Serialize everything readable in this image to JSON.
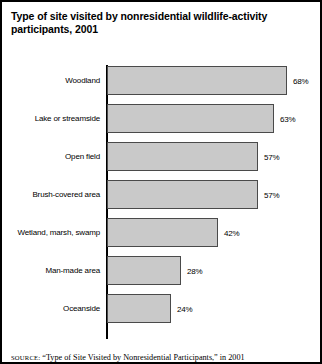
{
  "figure": {
    "title": "Type of site visited by nonresidential wildlife-activity participants, 2001",
    "source": "SOURCE: \"Type of Site Visited by Nonresidential Participants,\" in 2001",
    "source_prefix": "SOURCE:",
    "source_rest": " “Type of Site Visited by Nonresidential Participants,” in 2001",
    "bar_fill": "#c9c9c9",
    "bar_stroke": "#4a4a4a",
    "axis_color": "#000000",
    "border_color": "#000000"
  },
  "chart_data": {
    "type": "bar",
    "orientation": "horizontal",
    "title": "Type of site visited by nonresidential wildlife-activity participants, 2001",
    "xlabel": "",
    "ylabel": "",
    "xlim": [
      0,
      68
    ],
    "grid": false,
    "legend": null,
    "value_suffix": "%",
    "categories": [
      "Woodland",
      "Lake or streamside",
      "Open field",
      "Brush-covered area",
      "Wetland, marsh, swamp",
      "Man-made area",
      "Oceanside"
    ],
    "values": [
      68,
      63,
      57,
      57,
      42,
      28,
      24
    ],
    "value_labels": [
      "68%",
      "63%",
      "57%",
      "57%",
      "42%",
      "28%",
      "24%"
    ]
  }
}
